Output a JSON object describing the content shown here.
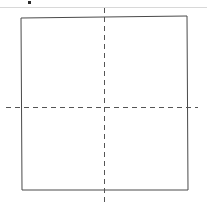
{
  "figure": {
    "title": "Square outline with dashed vertical and horizontal centerlines",
    "type": "technical-line-drawing",
    "canvas": {
      "width": 207,
      "height": 204,
      "background_color": "#ffffff"
    },
    "colors": {
      "outline_stroke": "#4a4a4a",
      "centerline_stroke": "#555555",
      "header_rule": "#d8d8d8",
      "corner_mark": "#2b2b2b",
      "background": "#ffffff"
    },
    "header_rule": {
      "name": "top-divider",
      "x1": 0,
      "y1": 7,
      "x2": 207,
      "y2": 7,
      "stroke_width": 1
    },
    "corner_mark": {
      "name": "top-left-glyph-fragment",
      "x": 28,
      "y": 1,
      "width": 3,
      "height": 3
    },
    "square": {
      "name": "square-outline",
      "stroke_width": 1,
      "points": [
        {
          "label": "top-left",
          "x": 21,
          "y": 18
        },
        {
          "label": "top-right",
          "x": 187,
          "y": 16
        },
        {
          "label": "bottom-right",
          "x": 188,
          "y": 190
        },
        {
          "label": "bottom-left",
          "x": 22,
          "y": 190
        }
      ]
    },
    "centerlines": [
      {
        "name": "vertical-centerline",
        "orientation": "vertical",
        "x1": 104,
        "y1": 8,
        "x2": 104,
        "y2": 203,
        "dash_pattern": "5 4",
        "stroke_width": 1
      },
      {
        "name": "horizontal-centerline",
        "orientation": "horizontal",
        "x1": 6,
        "y1": 107,
        "x2": 198,
        "y2": 107,
        "dash_pattern": "5 4",
        "stroke_width": 1
      }
    ],
    "center_point": {
      "name": "centerline-intersection",
      "x": 104,
      "y": 107
    }
  }
}
